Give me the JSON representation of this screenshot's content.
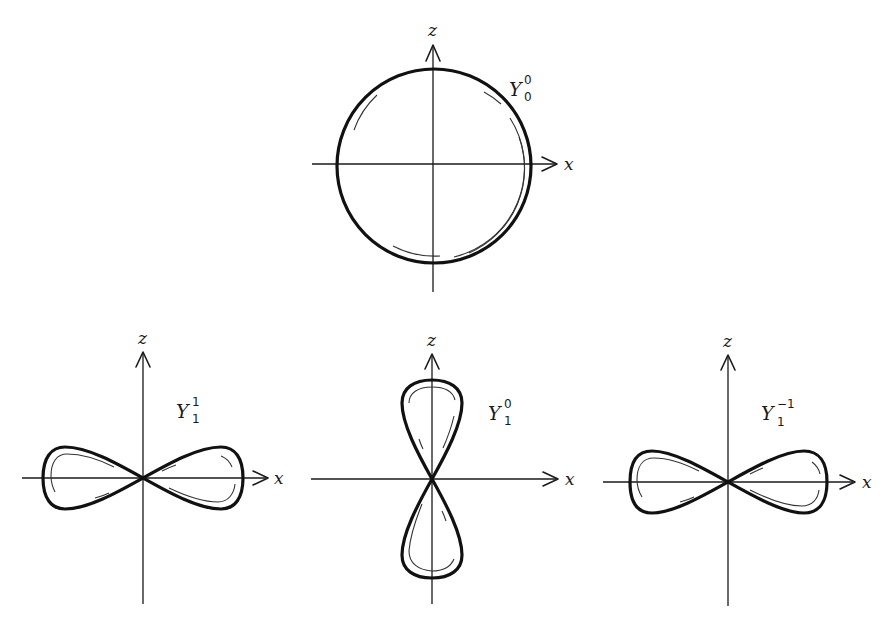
{
  "figure": {
    "panels": [
      {
        "id": "Y00",
        "label": {
          "base": "Y",
          "sup": "0",
          "sub": "0"
        },
        "x_axis_label": "x",
        "z_axis_label": "z",
        "shape": "sphere"
      },
      {
        "id": "Y11",
        "label": {
          "base": "Y",
          "sup": "1",
          "sub": "1"
        },
        "x_axis_label": "x",
        "z_axis_label": "z",
        "shape": "horizontal-dumbbell"
      },
      {
        "id": "Y10",
        "label": {
          "base": "Y",
          "sup": "0",
          "sub": "1"
        },
        "x_axis_label": "x",
        "z_axis_label": "z",
        "shape": "vertical-dumbbell"
      },
      {
        "id": "Y1m1",
        "label": {
          "base": "Y",
          "sup": "−1",
          "sub": "1"
        },
        "x_axis_label": "x",
        "z_axis_label": "z",
        "shape": "horizontal-dumbbell"
      }
    ]
  },
  "colors": {
    "ink": "#111111",
    "background": "#ffffff"
  }
}
